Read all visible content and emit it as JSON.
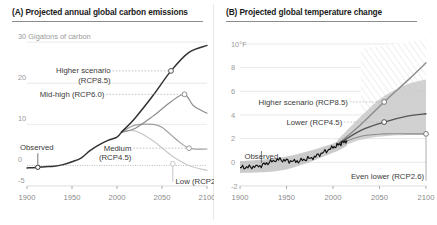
{
  "figure": {
    "background": "#ffffff",
    "divider_color": "#e8e8e8"
  },
  "panels": [
    {
      "id": "A",
      "title": "(A) Projected annual global carbon emissions",
      "y_unit_label": "30 Gigatons of carbon",
      "y_ticks": [
        "30",
        "20",
        "10",
        "0",
        "-5"
      ],
      "x_ticks": [
        "1900",
        "1950",
        "2000",
        "2050",
        "2100"
      ],
      "annotations": [
        {
          "name": "higher-scenario",
          "lines": [
            "Higher scenario",
            "(RCP8.5)"
          ]
        },
        {
          "name": "mid-high",
          "lines": [
            "Mid-high (RCP6.0)"
          ]
        },
        {
          "name": "medium",
          "lines": [
            "Medium",
            "(RCP4.5)"
          ]
        },
        {
          "name": "low",
          "lines": [
            "Low (RCP2.6)"
          ]
        },
        {
          "name": "observed",
          "lines": [
            "Observed"
          ]
        }
      ]
    },
    {
      "id": "B",
      "title": "(B) Projected global temperature change",
      "y_unit_label": "10°F",
      "y_ticks": [
        "10°F",
        "8",
        "6",
        "4",
        "2",
        "0",
        "-2"
      ],
      "x_ticks": [
        "1900",
        "1950",
        "2000",
        "2050",
        "2100"
      ],
      "annotations": [
        {
          "name": "higher-scenario",
          "lines": [
            "Higher scenario (RCP8.5)"
          ]
        },
        {
          "name": "lower",
          "lines": [
            "Lower (RCP4.5)"
          ]
        },
        {
          "name": "even-lower",
          "lines": [
            "Even lower (RCP2.6)"
          ]
        },
        {
          "name": "observed",
          "lines": [
            "Observed"
          ]
        }
      ]
    }
  ],
  "chart_data": [
    {
      "type": "line",
      "panel": "A",
      "title": "(A) Projected annual global carbon emissions",
      "xlabel": "",
      "ylabel": "Gigatons of carbon",
      "xlim": [
        1900,
        2100
      ],
      "ylim": [
        -5,
        31
      ],
      "xticks": [
        1900,
        1950,
        2000,
        2050,
        2100
      ],
      "yticks": [
        -5,
        0,
        10,
        20,
        30
      ],
      "grid": true,
      "legend": "inline-annotations",
      "series": [
        {
          "name": "Observed",
          "color": "#333333",
          "x": [
            1900,
            1910,
            1920,
            1930,
            1940,
            1950,
            1960,
            1970,
            1980,
            1990,
            2000,
            2005
          ],
          "values": [
            -0.6,
            -0.5,
            -0.3,
            -0.2,
            0.2,
            0.9,
            1.8,
            3.6,
            5.0,
            6.1,
            6.9,
            8.1
          ]
        },
        {
          "name": "Higher scenario (RCP8.5)",
          "color": "#333333",
          "x": [
            2005,
            2020,
            2040,
            2060,
            2080,
            2100
          ],
          "values": [
            8.1,
            11.5,
            17.0,
            23.0,
            27.5,
            29.2
          ],
          "endpoint_marker": {
            "x": 2060,
            "y": 23.0
          }
        },
        {
          "name": "Mid-high (RCP6.0)",
          "color": "#8c8c8c",
          "x": [
            2005,
            2020,
            2040,
            2060,
            2075,
            2085,
            2100
          ],
          "values": [
            8.1,
            9.0,
            12.0,
            15.5,
            17.3,
            14.5,
            12.7
          ],
          "endpoint_marker": {
            "x": 2075,
            "y": 17.3
          }
        },
        {
          "name": "Medium (RCP4.5)",
          "color": "#9e9e9e",
          "x": [
            2005,
            2020,
            2040,
            2050,
            2065,
            2080,
            2100
          ],
          "values": [
            8.1,
            9.8,
            10.0,
            9.3,
            6.5,
            4.2,
            4.0
          ],
          "endpoint_marker": {
            "x": 2080,
            "y": 4.2
          }
        },
        {
          "name": "Low (RCP2.6)",
          "color": "#c9c9c9",
          "x": [
            2005,
            2020,
            2040,
            2060,
            2080,
            2100
          ],
          "values": [
            8.1,
            8.4,
            6.0,
            2.5,
            0.0,
            -1.2
          ],
          "endpoint_marker": {
            "x": 2062,
            "y": 0.4
          }
        }
      ]
    },
    {
      "type": "line",
      "panel": "B",
      "title": "(B) Projected global temperature change",
      "xlabel": "",
      "ylabel": "°F",
      "xlim": [
        1900,
        2100
      ],
      "ylim": [
        -2,
        10.5
      ],
      "xticks": [
        1900,
        1950,
        2000,
        2050,
        2100
      ],
      "yticks": [
        -2,
        0,
        2,
        4,
        6,
        8,
        10
      ],
      "grid": true,
      "legend": "inline-annotations",
      "series": [
        {
          "name": "Observed",
          "color": "#111111",
          "x": [
            1900,
            1920,
            1940,
            1960,
            1980,
            2000,
            2015
          ],
          "values": [
            -0.45,
            -0.35,
            0.25,
            0.05,
            0.45,
            1.25,
            1.85
          ]
        },
        {
          "name": "Higher scenario (RCP8.5)",
          "color": "#8c8c8c",
          "x": [
            2005,
            2030,
            2055,
            2080,
            2100
          ],
          "values": [
            1.5,
            3.2,
            5.1,
            6.9,
            8.4
          ],
          "endpoint_marker": {
            "x": 2055,
            "y": 5.1
          }
        },
        {
          "name": "Lower (RCP4.5)",
          "color": "#555555",
          "x": [
            2005,
            2030,
            2055,
            2080,
            2100
          ],
          "values": [
            1.5,
            2.7,
            3.4,
            3.9,
            4.1
          ],
          "endpoint_marker": {
            "x": 2055,
            "y": 3.4
          }
        },
        {
          "name": "Even lower (RCP2.6)",
          "color": "#8c8c8c",
          "x": [
            2005,
            2030,
            2055,
            2080,
            2100
          ],
          "values": [
            1.5,
            2.2,
            2.4,
            2.4,
            2.4
          ],
          "endpoint_marker": {
            "x": 2100,
            "y": 2.4
          }
        }
      ],
      "bands": [
        {
          "name": "observed-uncertainty",
          "fill": "#bdbdbd",
          "x": [
            1900,
            1950,
            2000,
            2015
          ],
          "upper": [
            0.1,
            0.5,
            1.6,
            2.3
          ],
          "lower": [
            -0.9,
            -0.6,
            0.8,
            1.4
          ]
        },
        {
          "name": "projection-uncertainty",
          "fill": "#c4c4c4",
          "x": [
            2005,
            2030,
            2055,
            2080,
            2100
          ],
          "upper": [
            1.9,
            3.9,
            5.6,
            6.6,
            7.0
          ],
          "lower": [
            1.2,
            1.9,
            2.2,
            2.3,
            2.3
          ]
        },
        {
          "name": "hatched-high-range",
          "fill": "hatch",
          "x": [
            2030,
            2100
          ],
          "upper": [
            9.6,
            10.4
          ],
          "lower": [
            3.2,
            6.9
          ]
        }
      ]
    }
  ]
}
